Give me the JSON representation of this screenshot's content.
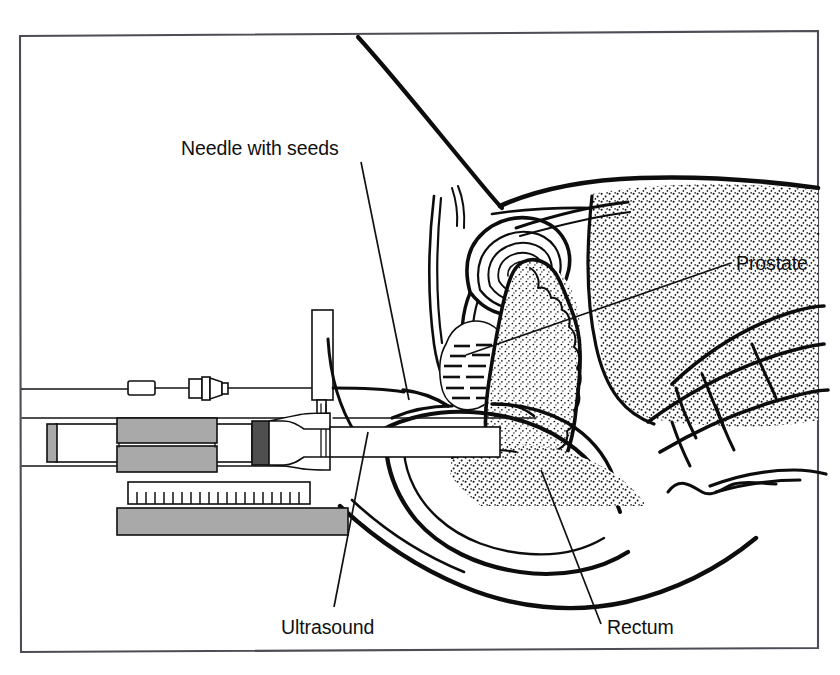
{
  "figure": {
    "kind": "medical-illustration",
    "title_visible": false,
    "background_color": "#ffffff",
    "ink_color": "#101010",
    "frame": {
      "visible": true,
      "color": "#4d4d55",
      "x": 20,
      "y": 31,
      "width": 798,
      "height": 621
    },
    "labels": [
      {
        "id": "needle-with-seeds",
        "text": "Needle with seeds",
        "x": 181,
        "y": 155,
        "anchor": "start",
        "leader": {
          "from": [
            361,
            162
          ],
          "to": [
            409,
            400
          ]
        }
      },
      {
        "id": "prostate",
        "text": "Prostate",
        "x": 736,
        "y": 270,
        "anchor": "start",
        "leader": {
          "from": [
            731,
            263
          ],
          "to": [
            466,
            355
          ]
        }
      },
      {
        "id": "ultrasound",
        "text": "Ultrasound",
        "x": 281,
        "y": 634,
        "anchor": "start",
        "leader": {
          "from": [
            334,
            607
          ],
          "to": [
            368,
            432
          ]
        }
      },
      {
        "id": "rectum",
        "text": "Rectum",
        "x": 607,
        "y": 634,
        "anchor": "start",
        "leader": {
          "from": [
            601,
            624
          ],
          "to": [
            541,
            470
          ]
        }
      }
    ],
    "anatomy_parts": [
      "abdominal-wall",
      "bladder",
      "pubic-bone",
      "prostate-gland",
      "seminal-vesicle",
      "rectum",
      "sacrum-vertebrae",
      "coccyx",
      "perineum",
      "urethra"
    ],
    "equipment_parts": [
      "needle-stylet-handle",
      "luer-hub",
      "needle-shaft",
      "needle-guide-post",
      "ultrasound-probe",
      "probe-stepper-clamp",
      "measuring-scale",
      "stepper-base-plate"
    ]
  },
  "equipment": {
    "stylet_handle": {
      "x": 128,
      "y": 382,
      "width": 26,
      "height": 13
    },
    "luer_hub": {
      "x": 188,
      "y": 378,
      "width": 34,
      "height": 22
    },
    "needle_line": {
      "y": 389,
      "x_start": 154,
      "x_end": 420
    },
    "guide_post": {
      "x": 312,
      "y": 310,
      "width": 21,
      "height": 90
    },
    "probe_body": {
      "x": 52,
      "y": 424,
      "width": 228,
      "height": 38
    },
    "probe_tip_x": 500,
    "clamp_upper": {
      "x": 117,
      "y": 420,
      "width": 97,
      "height": 23
    },
    "clamp_lower": {
      "x": 117,
      "y": 447,
      "width": 97,
      "height": 23
    },
    "dark_collar": {
      "x": 252,
      "y": 421,
      "width": 16,
      "height": 44
    },
    "left_end_cap": {
      "x": 47,
      "y": 424,
      "width": 9,
      "height": 37
    },
    "scale": {
      "x": 128,
      "y": 482,
      "width": 182,
      "height": 21,
      "tick_count": 19
    },
    "base_plate": {
      "x": 117,
      "y": 508,
      "width": 230,
      "height": 26
    }
  }
}
